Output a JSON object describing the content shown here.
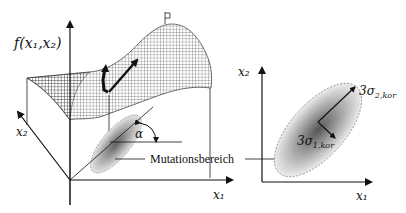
{
  "left_panel": {
    "function_label": "f(x₁,x₂)",
    "axis_x1_label": "x₁",
    "axis_x2_label": "x₂",
    "angle_label": "α",
    "mutation_label": "Mutationsbereich"
  },
  "right_panel": {
    "axis_x1_label": "x₁",
    "axis_x2_label": "x₂",
    "sigma2_label_main": "3σ",
    "sigma2_label_sub": "2,kor",
    "sigma1_label_main": "3σ",
    "sigma1_label_sub": "1,kor"
  },
  "colors": {
    "ink": "#111111",
    "mesh": "#444444",
    "ellipse_dark": "#6a6a6a",
    "ellipse_light": "#e6e6e6"
  }
}
